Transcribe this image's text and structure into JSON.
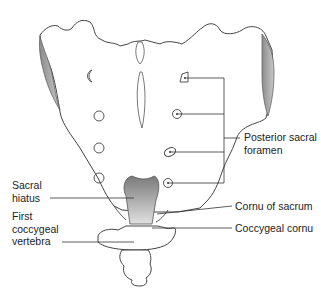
{
  "figure": {
    "colors": {
      "outline": "#444444",
      "shade": "#9a9a9a",
      "leader": "#333333",
      "text": "#222222"
    }
  },
  "labels": {
    "posterior_sacral_foramen": {
      "line1": "Posterior sacral",
      "line2": "foramen"
    },
    "sacral_hiatus": {
      "line1": "Sacral",
      "line2": "hiatus"
    },
    "first_coccygeal_vertebra": {
      "line1": "First",
      "line2": "coccygeal",
      "line3": "vertebra"
    },
    "cornu_of_sacrum": "Cornu of sacrum",
    "coccygeal_cornu": "Coccygeal cornu"
  }
}
